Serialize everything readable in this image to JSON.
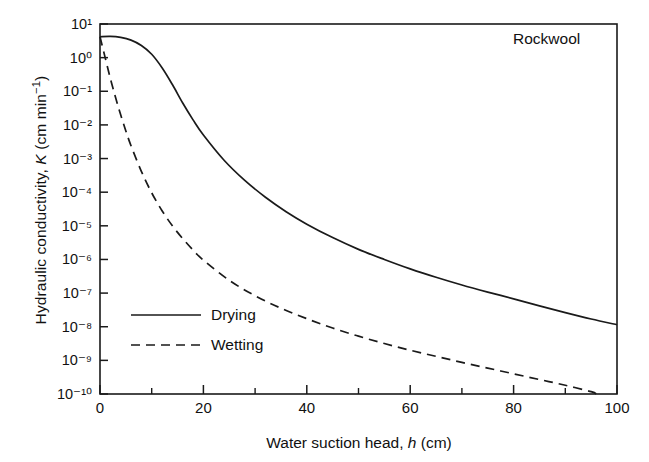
{
  "chart_data": {
    "type": "line",
    "title": "",
    "annotation": "Rockwool",
    "xlabel_text": "Water suction head, ",
    "xlabel_symbol": "h",
    "xlabel_units": " (cm)",
    "ylabel_text": "Hydraulic conductivity, ",
    "ylabel_symbol": "K",
    "ylabel_units_open": " (cm min",
    "ylabel_units_exp": "−1",
    "ylabel_units_close": ")",
    "xlim": [
      0,
      100
    ],
    "ylim_log10": [
      -10,
      1
    ],
    "xticks": [
      0,
      20,
      40,
      60,
      80,
      100
    ],
    "xticks_labels": [
      "0",
      "20",
      "40",
      "60",
      "80",
      "100"
    ],
    "xticks_minor": [
      10,
      30,
      50,
      70,
      90
    ],
    "yticks_log10": [
      1,
      0,
      -1,
      -2,
      -3,
      -4,
      -5,
      -6,
      -7,
      -8,
      -9,
      -10
    ],
    "yticks_labels": [
      "10¹",
      "10⁰",
      "10⁻¹",
      "10⁻²",
      "10⁻³",
      "10⁻⁴",
      "10⁻⁵",
      "10⁻⁶",
      "10⁻⁷",
      "10⁻⁸",
      "10⁻⁹",
      "10⁻¹⁰"
    ],
    "grid": false,
    "legend_position": "lower-left-inside",
    "series": [
      {
        "name": "Drying",
        "style": "solid",
        "color": "#1a1a1a",
        "x": [
          0,
          2,
          4,
          6,
          8,
          10,
          12,
          14,
          16,
          18,
          20,
          24,
          28,
          32,
          36,
          40,
          45,
          50,
          55,
          60,
          65,
          70,
          75,
          80,
          85,
          90,
          95,
          100
        ],
        "y_log10": [
          0.62,
          0.63,
          0.6,
          0.52,
          0.36,
          0.1,
          -0.3,
          -0.8,
          -1.35,
          -1.85,
          -2.3,
          -3.05,
          -3.65,
          -4.15,
          -4.58,
          -4.95,
          -5.35,
          -5.7,
          -6.0,
          -6.28,
          -6.53,
          -6.76,
          -6.97,
          -7.17,
          -7.38,
          -7.58,
          -7.77,
          -7.94
        ]
      },
      {
        "name": "Wetting",
        "style": "dashed",
        "color": "#1a1a1a",
        "x": [
          0,
          1,
          2,
          3,
          4,
          5,
          6,
          8,
          10,
          12,
          14,
          16,
          18,
          20,
          25,
          30,
          35,
          40,
          45,
          50,
          55,
          60,
          65,
          70,
          75,
          80,
          85,
          90,
          95,
          96
        ],
        "y_log10": [
          0.62,
          0.0,
          -0.62,
          -1.18,
          -1.7,
          -2.18,
          -2.62,
          -3.38,
          -4.02,
          -4.55,
          -5.0,
          -5.38,
          -5.72,
          -6.02,
          -6.62,
          -7.08,
          -7.45,
          -7.76,
          -8.04,
          -8.28,
          -8.5,
          -8.7,
          -8.88,
          -9.06,
          -9.23,
          -9.4,
          -9.57,
          -9.74,
          -9.93,
          -10.0
        ]
      }
    ]
  },
  "legend": {
    "items": [
      {
        "label": "Drying",
        "style": "solid"
      },
      {
        "label": "Wetting",
        "style": "dashed"
      }
    ]
  }
}
